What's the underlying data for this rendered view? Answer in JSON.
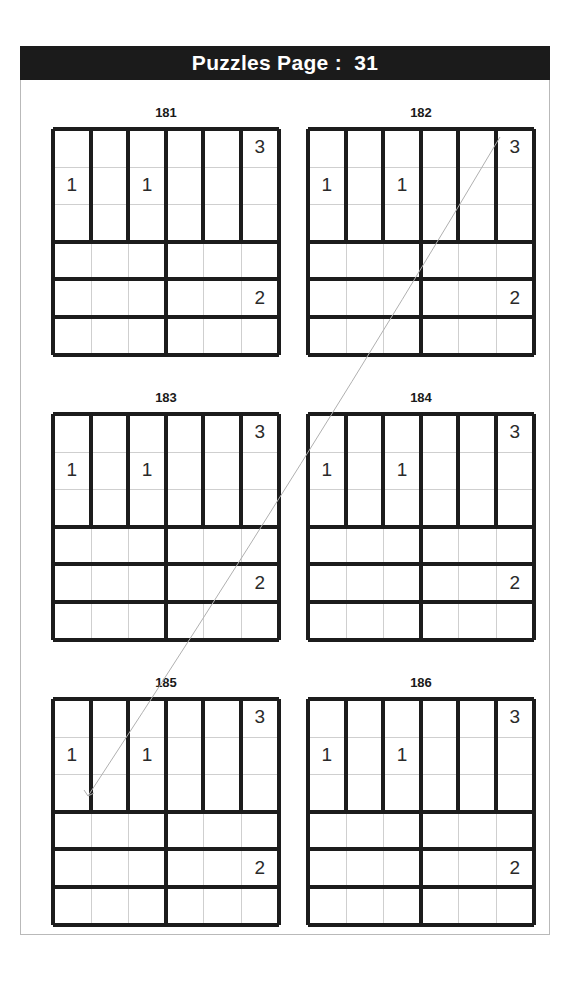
{
  "header": {
    "title": "Puzzles Page :  31",
    "page_number": "31",
    "background_color": "#1b1b1b",
    "text_color": "#ffffff"
  },
  "puzzle_layout": {
    "columns": 2,
    "rows": 3,
    "grid_size": 6,
    "cell_px": 37.6
  },
  "style": {
    "thick_line_color": "#1c1c1c",
    "thin_line_color": "#cfcfcf",
    "digit_color": "#2a2a2a",
    "page_border_color": "#b9b9b9",
    "scan_artifact_color": "#b0b0b0"
  },
  "puzzles": [
    {
      "label": "181",
      "x": 53,
      "y": 129,
      "givens": [
        {
          "row": 1,
          "col": 6,
          "value": "3"
        },
        {
          "row": 2,
          "col": 1,
          "value": "1"
        },
        {
          "row": 2,
          "col": 3,
          "value": "1"
        },
        {
          "row": 5,
          "col": 6,
          "value": "2"
        }
      ]
    },
    {
      "label": "182",
      "x": 308,
      "y": 129,
      "givens": [
        {
          "row": 1,
          "col": 6,
          "value": "3"
        },
        {
          "row": 2,
          "col": 1,
          "value": "1"
        },
        {
          "row": 2,
          "col": 3,
          "value": "1"
        },
        {
          "row": 5,
          "col": 6,
          "value": "2"
        }
      ]
    },
    {
      "label": "183",
      "x": 53,
      "y": 414,
      "givens": [
        {
          "row": 1,
          "col": 6,
          "value": "3"
        },
        {
          "row": 2,
          "col": 1,
          "value": "1"
        },
        {
          "row": 2,
          "col": 3,
          "value": "1"
        },
        {
          "row": 5,
          "col": 6,
          "value": "2"
        }
      ]
    },
    {
      "label": "184",
      "x": 308,
      "y": 414,
      "givens": [
        {
          "row": 1,
          "col": 6,
          "value": "3"
        },
        {
          "row": 2,
          "col": 1,
          "value": "1"
        },
        {
          "row": 2,
          "col": 3,
          "value": "1"
        },
        {
          "row": 5,
          "col": 6,
          "value": "2"
        }
      ]
    },
    {
      "label": "185",
      "x": 53,
      "y": 699,
      "givens": [
        {
          "row": 1,
          "col": 6,
          "value": "3"
        },
        {
          "row": 2,
          "col": 1,
          "value": "1"
        },
        {
          "row": 2,
          "col": 3,
          "value": "1"
        },
        {
          "row": 5,
          "col": 6,
          "value": "2"
        }
      ]
    },
    {
      "label": "186",
      "x": 308,
      "y": 699,
      "givens": [
        {
          "row": 1,
          "col": 6,
          "value": "3"
        },
        {
          "row": 2,
          "col": 1,
          "value": "1"
        },
        {
          "row": 2,
          "col": 3,
          "value": "1"
        },
        {
          "row": 5,
          "col": 6,
          "value": "2"
        }
      ]
    }
  ],
  "cages": {
    "description": "Shared cage layout for every puzzle: rows 1-3 are six vertical 3-cell cages (one per column); rows 4-6 are six horizontal 3-cell cages (cols 1-3 and cols 4-6 in each row).",
    "vertical_region_rows": [
      1,
      2,
      3
    ],
    "horizontal_region_rows": [
      4,
      5,
      6
    ],
    "vertical_cage_columns": [
      1,
      2,
      3,
      4,
      5,
      6
    ],
    "horizontal_cage_splits": [
      [
        1,
        3
      ],
      [
        4,
        6
      ]
    ]
  },
  "scan_artifact": {
    "type": "diagonal-pen-line",
    "from_x": 500,
    "from_y": 137,
    "to_x": 88,
    "to_y": 796
  }
}
